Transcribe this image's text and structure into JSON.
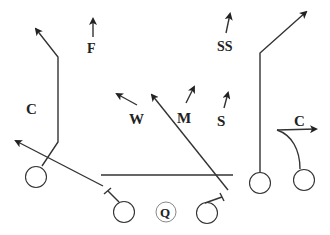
{
  "diagram": {
    "defense_labels": {
      "left_corner": "C",
      "free_safety": "F",
      "strong_safety": "SS",
      "will": "W",
      "mike": "M",
      "sam": "S",
      "right_corner": "C"
    },
    "offense_labels": {
      "quarterback": "Q"
    },
    "colors": {
      "ink": "#333333",
      "background": "#ffffff"
    }
  }
}
